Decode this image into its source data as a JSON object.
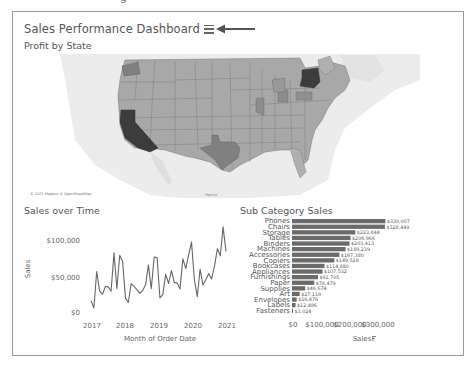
{
  "header": {
    "title": "Sales Performance Dashboard",
    "menu_icon": "hamburger-icon",
    "annotation_icon": "arrow-left-icon"
  },
  "map": {
    "title": "Profit by State",
    "attribution": "© 2021 Mapbox © OpenStreetMap",
    "place_label": "Mexico",
    "colors": {
      "dark": "#3c3c3c",
      "mid": "#808080",
      "light": "#b0b0b0",
      "base": "#a6a6a6",
      "water": "#ffffff",
      "land": "#e8e8e8"
    }
  },
  "line_chart": {
    "title": "Sales over Time",
    "ylabel": "Sales",
    "xlabel": "Month of Order Date",
    "yticks": [
      "$100,000",
      "$50,000",
      "$0"
    ],
    "xticks": [
      "2017",
      "2018",
      "2019",
      "2020",
      "2021"
    ]
  },
  "bar_chart": {
    "title": "Sub Category Sales",
    "xlabel": "Sales",
    "sort_icon": "sort-descending-icon",
    "xticks": [
      "$0",
      "$100,000",
      "$200,000",
      "$300,000"
    ]
  },
  "chart_data": [
    {
      "type": "line",
      "title": "Sales over Time",
      "xlabel": "Month of Order Date",
      "ylabel": "Sales",
      "ylim": [
        0,
        125000
      ],
      "x_range": [
        "2017-01",
        "2020-12"
      ],
      "xtick_labels": [
        "2017",
        "2018",
        "2019",
        "2020",
        "2021"
      ],
      "ytick_labels": [
        "$0",
        "$50,000",
        "$100,000"
      ],
      "grid": false,
      "values": [
        14237,
        4520,
        55691,
        28295,
        23648,
        34595,
        33946,
        27909,
        81777,
        31453,
        78629,
        69546,
        18174,
        11951,
        38726,
        34195,
        30132,
        24797,
        28765,
        36898,
        64596,
        31405,
        75973,
        74920,
        18542,
        22979,
        51716,
        38750,
        56988,
        40344,
        39262,
        31115,
        73410,
        59688,
        79412,
        96999,
        43971,
        20301,
        58872,
        36522,
        44261,
        52981,
        45264,
        63121,
        87866,
        77777,
        118448,
        83829
      ]
    },
    {
      "type": "bar",
      "orientation": "horizontal",
      "title": "Sub Category Sales",
      "xlabel": "Sales",
      "xlim": [
        0,
        350000
      ],
      "xtick_labels": [
        "$0",
        "$100,000",
        "$200,000",
        "$300,000"
      ],
      "categories": [
        "Phones",
        "Chairs",
        "Storage",
        "Tables",
        "Binders",
        "Machines",
        "Accessories",
        "Copiers",
        "Bookcases",
        "Appliances",
        "Furnishings",
        "Paper",
        "Supplies",
        "Art",
        "Envelopes",
        "Labels",
        "Fasteners"
      ],
      "values": [
        330007,
        328449,
        223844,
        206966,
        203413,
        189239,
        167380,
        149528,
        114880,
        107532,
        91705,
        78479,
        46674,
        27119,
        16476,
        12486,
        3024
      ],
      "value_labels": [
        "$330,007",
        "$328,449",
        "$223,844",
        "$206,966",
        "$203,413",
        "$189,239",
        "$167,380",
        "$149,528",
        "$114,880",
        "$107,532",
        "$91,705",
        "$78,479",
        "$46,674",
        "$27,119",
        "$16,476",
        "$12,486",
        "$3,024"
      ]
    }
  ]
}
